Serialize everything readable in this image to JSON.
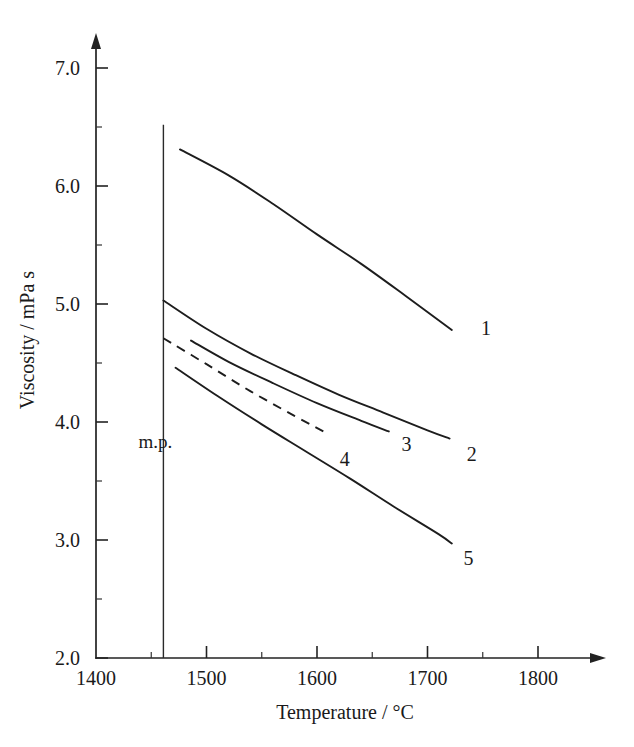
{
  "chart_data": {
    "type": "line",
    "title": "",
    "xlabel": "Temperature / °C",
    "ylabel": "Viscosity / mPa s",
    "xlim": [
      1400,
      1845
    ],
    "ylim": [
      2.0,
      7.3
    ],
    "x_ticks": [
      1400,
      1500,
      1600,
      1700,
      1800
    ],
    "x_tick_labels": [
      "1400",
      "1500",
      "1600",
      "1700",
      "1800"
    ],
    "x_minor_ticks": [
      1450,
      1550,
      1650,
      1750
    ],
    "y_ticks": [
      2.0,
      3.0,
      4.0,
      5.0,
      6.0,
      7.0
    ],
    "y_tick_labels": [
      "2.0",
      "3.0",
      "4.0",
      "5.0",
      "6.0",
      "7.0"
    ],
    "y_minor_ticks": [
      2.5,
      3.5,
      4.5,
      5.5,
      6.5
    ],
    "grid": false,
    "legend": "inline-end-labels",
    "annotations": [
      {
        "name": "melting-point-marker",
        "label": "m.p.",
        "x": 1461,
        "y_from": 2.0,
        "y_to": 6.52,
        "style": "vertical-line"
      }
    ],
    "series": [
      {
        "name": "1",
        "label": "1",
        "style": "solid",
        "label_x": 1753,
        "label_y": 4.8,
        "points": [
          {
            "x": 1476,
            "y": 6.31
          },
          {
            "x": 1520,
            "y": 6.09
          },
          {
            "x": 1560,
            "y": 5.85
          },
          {
            "x": 1600,
            "y": 5.59
          },
          {
            "x": 1640,
            "y": 5.34
          },
          {
            "x": 1680,
            "y": 5.07
          },
          {
            "x": 1722,
            "y": 4.78
          }
        ]
      },
      {
        "name": "2",
        "label": "2",
        "style": "solid",
        "label_x": 1740,
        "label_y": 3.73,
        "points": [
          {
            "x": 1461,
            "y": 5.03
          },
          {
            "x": 1500,
            "y": 4.79
          },
          {
            "x": 1540,
            "y": 4.58
          },
          {
            "x": 1580,
            "y": 4.4
          },
          {
            "x": 1620,
            "y": 4.23
          },
          {
            "x": 1660,
            "y": 4.08
          },
          {
            "x": 1700,
            "y": 3.93
          },
          {
            "x": 1720,
            "y": 3.86
          }
        ]
      },
      {
        "name": "3",
        "label": "3",
        "style": "solid",
        "label_x": 1681,
        "label_y": 3.81,
        "points": [
          {
            "x": 1486,
            "y": 4.69
          },
          {
            "x": 1520,
            "y": 4.51
          },
          {
            "x": 1560,
            "y": 4.33
          },
          {
            "x": 1600,
            "y": 4.16
          },
          {
            "x": 1640,
            "y": 4.01
          },
          {
            "x": 1665,
            "y": 3.92
          }
        ]
      },
      {
        "name": "4",
        "label": "4",
        "style": "dashed",
        "label_x": 1625,
        "label_y": 3.69,
        "points": [
          {
            "x": 1461,
            "y": 4.71
          },
          {
            "x": 1500,
            "y": 4.49
          },
          {
            "x": 1540,
            "y": 4.26
          },
          {
            "x": 1580,
            "y": 4.05
          },
          {
            "x": 1610,
            "y": 3.9
          }
        ]
      },
      {
        "name": "5",
        "label": "5",
        "style": "solid",
        "label_x": 1737,
        "label_y": 2.85,
        "points": [
          {
            "x": 1472,
            "y": 4.46
          },
          {
            "x": 1510,
            "y": 4.22
          },
          {
            "x": 1550,
            "y": 3.98
          },
          {
            "x": 1590,
            "y": 3.75
          },
          {
            "x": 1630,
            "y": 3.52
          },
          {
            "x": 1670,
            "y": 3.28
          },
          {
            "x": 1710,
            "y": 3.05
          },
          {
            "x": 1722,
            "y": 2.97
          }
        ]
      }
    ]
  },
  "colors": {
    "background": "#ffffff",
    "ink": "#1a1a1a",
    "curve": "#1d1d1d"
  }
}
